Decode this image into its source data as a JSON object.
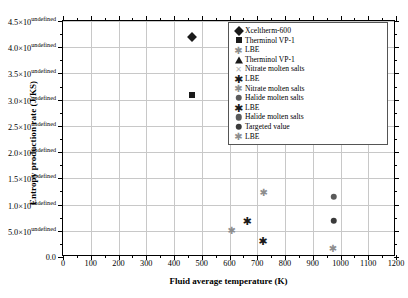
{
  "chart_data": {
    "type": "scatter",
    "title": "",
    "xlabel": "Fluid average temperature (K)",
    "ylabel": "Entropy production rate (J/KS)",
    "xlim": [
      0,
      1200
    ],
    "ylim": [
      0,
      45000
    ],
    "xticks": [
      0,
      100,
      200,
      300,
      400,
      500,
      600,
      700,
      800,
      900,
      1000,
      1100,
      1200
    ],
    "xticklabels": [
      "0",
      "100",
      "200",
      "300",
      "400",
      "500",
      "600",
      "700",
      "800",
      "900",
      "1000",
      "1100",
      "1200"
    ],
    "yticks": [
      0,
      5000,
      10000,
      15000,
      20000,
      25000,
      30000,
      35000,
      40000,
      45000
    ],
    "yticklabels": [
      "0.0",
      "5.0×10³",
      "1.0×10⁴",
      "1.5×10⁴",
      "2.0×10⁴",
      "2.5×10⁴",
      "3.0×10⁴",
      "3.5×10⁴",
      "4.0×10⁴",
      "4.5×10⁴"
    ],
    "grid": true,
    "legend_position": "upper right",
    "series": [
      {
        "name": "Xceltherm-600",
        "marker": "diamond",
        "x": [
          465
        ],
        "y": [
          42000
        ]
      },
      {
        "name": "Therminol VP-1",
        "marker": "square",
        "x": [
          465
        ],
        "y": [
          30800
        ]
      },
      {
        "name": "LBE",
        "marker": "star-lt",
        "x": [
          610
        ],
        "y": [
          5200
        ]
      },
      {
        "name": "Therminol VP-1",
        "marker": "triangle",
        "x": [
          612
        ],
        "y": [
          25000
        ]
      },
      {
        "name": "Nitrate molten salts",
        "marker": "x",
        "x": [
          610
        ],
        "y": [
          27200
        ]
      },
      {
        "name": "LBE",
        "marker": "star",
        "x": [
          665
        ],
        "y": [
          6900
        ]
      },
      {
        "name": "Nitrate molten salts",
        "marker": "star-lt",
        "x": [
          725
        ],
        "y": [
          12300
        ]
      },
      {
        "name": "Halide molten salts",
        "marker": "circle",
        "x": [
          722
        ],
        "y": [
          27700
        ]
      },
      {
        "name": "LBE",
        "marker": "star",
        "x": [
          722
        ],
        "y": [
          3100
        ]
      },
      {
        "name": "Halide molten salts",
        "marker": "circle",
        "x": [
          975
        ],
        "y": [
          11500
        ]
      },
      {
        "name": "Targeted value",
        "marker": "circle-dk",
        "x": [
          975
        ],
        "y": [
          6900
        ]
      },
      {
        "name": "LBE",
        "marker": "star-lt",
        "x": [
          975
        ],
        "y": [
          1800
        ]
      }
    ]
  },
  "axes": {
    "xlabel": "Fluid average temperature (K)",
    "ylabel": "Entropy production rate (J/KS)"
  },
  "legend": {
    "items": [
      {
        "label": "Xceltherm-600",
        "marker": "diamond"
      },
      {
        "label": "Therminol VP-1",
        "marker": "square"
      },
      {
        "label": "LBE",
        "marker": "star-lt"
      },
      {
        "label": "Therminol VP-1",
        "marker": "triangle"
      },
      {
        "label": "Nitrate molten salts",
        "marker": "x"
      },
      {
        "label": "LBE",
        "marker": "star"
      },
      {
        "label": "Nitrate molten salts",
        "marker": "star-lt"
      },
      {
        "label": "Halide molten salts",
        "marker": "circle"
      },
      {
        "label": "LBE",
        "marker": "star"
      },
      {
        "label": "Halide molten salts",
        "marker": "circle"
      },
      {
        "label": "Targeted value",
        "marker": "circle-dk"
      },
      {
        "label": "LBE",
        "marker": "star-lt"
      }
    ]
  },
  "colors": {
    "marker_dark": "#1a1a1a",
    "marker_mid": "#5a5a5a",
    "marker_light": "#b4b4b4",
    "grid": "#c8c8c8",
    "axis": "#000000"
  }
}
